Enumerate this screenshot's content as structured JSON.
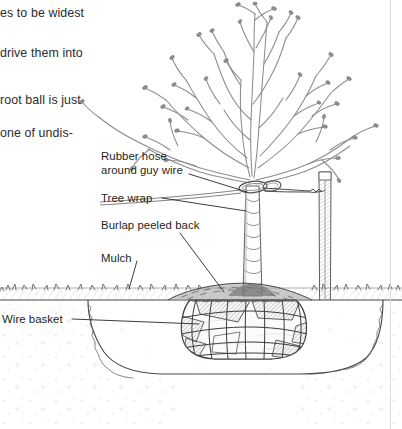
{
  "page": {
    "width": 402,
    "height": 429,
    "background": "#ffffff",
    "kind": "instructional-line-illustration"
  },
  "colors": {
    "ink": "#231f20",
    "body_text": "#2b2b2b",
    "leader_line": "#3a3a3a",
    "sketch_light": "#9a9a9a",
    "sketch_mid": "#6e6e6e",
    "sketch_dark": "#3f3f3f",
    "soil_fill": "#fbfbfb",
    "rule": "#d8d8d8"
  },
  "running_text": {
    "note": "Clipped body copy from the facing column, cut off at the left page edge",
    "lines": [
      {
        "text": "es to be widest",
        "x": 0,
        "y": 6
      },
      {
        "text": "drive them into",
        "x": 0,
        "y": 46
      },
      {
        "text": "root ball is just",
        "x": 0,
        "y": 93
      },
      {
        "text": "one of undis-",
        "x": 0,
        "y": 126
      }
    ]
  },
  "callouts": [
    {
      "id": "rubber-hose",
      "lines": [
        "Rubber hose",
        "around guy wire"
      ],
      "x": 101,
      "y": 150,
      "leader": {
        "x1": 189,
        "y1": 174,
        "x2": 247,
        "y2": 192
      }
    },
    {
      "id": "tree-wrap",
      "lines": [
        "Tree wrap"
      ],
      "x": 101,
      "y": 192,
      "leader": {
        "x1": 162,
        "y1": 198,
        "x2": 246,
        "y2": 211
      }
    },
    {
      "id": "burlap-peeled-back",
      "lines": [
        "Burlap peeled back"
      ],
      "x": 101,
      "y": 219,
      "leader": {
        "x1": 180,
        "y1": 233,
        "x2": 224,
        "y2": 292
      }
    },
    {
      "id": "mulch",
      "lines": [
        "Mulch"
      ],
      "x": 101,
      "y": 252,
      "leader": {
        "x1": 137,
        "y1": 261,
        "x2": 129,
        "y2": 289
      }
    },
    {
      "id": "wire-basket",
      "lines": [
        "Wire basket"
      ],
      "x": 2,
      "y": 313,
      "leader": {
        "x1": 72,
        "y1": 319,
        "x2": 199,
        "y2": 324
      }
    }
  ],
  "scene": {
    "ground_line_y": 300,
    "tree": {
      "trunk_x": 252,
      "trunk_top_y": 176,
      "trunk_base_y": 296,
      "description": "bare deciduous nursery tree with buds on twigs"
    },
    "stake": {
      "x": 325,
      "top_y": 172,
      "tip_y": 414,
      "label": "wooden stake driven below hole depth"
    },
    "guy_wire": {
      "from_x": 262,
      "to_x": 322,
      "y": 191
    },
    "root_ball": {
      "center_x": 245,
      "top_y": 300,
      "bottom_y": 357,
      "half_width": 55
    },
    "hole": {
      "left_x": 88,
      "right_x": 383,
      "bottom_y": 372
    }
  }
}
